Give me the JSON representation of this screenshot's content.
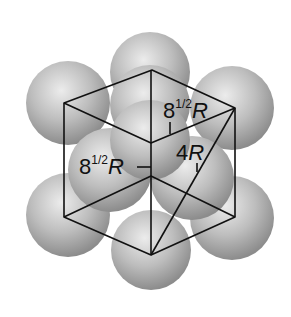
{
  "figure": {
    "labels": {
      "face_diagonal_top": {
        "base": "8",
        "exp": "1/2",
        "var": "R"
      },
      "edge_left": {
        "base": "8",
        "exp": "1/2",
        "var": "R"
      },
      "body_diagonal": {
        "base": "4",
        "var": "R"
      }
    },
    "colors": {
      "sphere_light": "#e6e6e6",
      "sphere_dark": "#8a8a8a",
      "line": "#111111",
      "background": "#ffffff"
    }
  }
}
